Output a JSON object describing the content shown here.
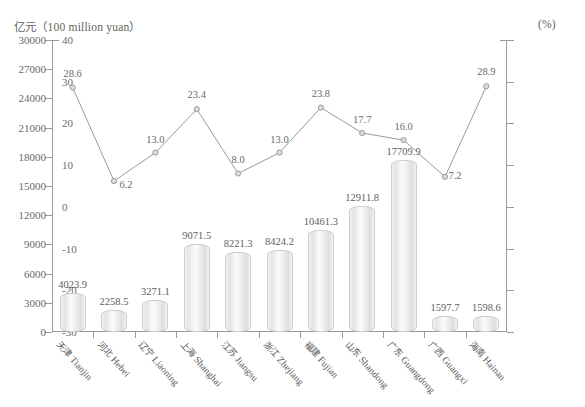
{
  "axes": {
    "left_unit": "亿元（100 million yuan）",
    "right_unit": "(%)",
    "left_ticks": [
      "30000",
      "27000",
      "24000",
      "21000",
      "18000",
      "15000",
      "12000",
      "9000",
      "6000",
      "3000",
      "0"
    ],
    "right_ticks": [
      "40",
      "30",
      "20",
      "10",
      "0",
      "-10",
      "-20",
      "-30"
    ]
  },
  "chart_data": {
    "type": "bar",
    "title": "",
    "subtitle": "",
    "xlabel": "",
    "ylabel": "亿元（100 million yuan）",
    "y2label": "(%)",
    "ylim": [
      0,
      30000
    ],
    "y2lim": [
      -30,
      40
    ],
    "grid": false,
    "legend": "none",
    "categories": [
      "天津 Tianjin",
      "河北 Hebei",
      "辽宁 Liaoning",
      "上海 Shanghai",
      "江苏 Jiangsu",
      "浙江 Zhejiang",
      "福建 Fujian",
      "山东 Shandong",
      "广东 Guangdong",
      "广西 Guangxi",
      "海南 Hainan"
    ],
    "series": [
      {
        "name": "亿元 (100 million yuan)",
        "type": "bar",
        "axis": "left",
        "values": [
          4023.9,
          2258.5,
          3271.1,
          9071.5,
          8221.3,
          8424.2,
          10461.3,
          12911.8,
          17709.9,
          1597.7,
          1598.6
        ],
        "labels": [
          "4023.9",
          "2258.5",
          "3271.1",
          "9071.5",
          "8221.3",
          "8424.2",
          "10461.3",
          "12911.8",
          "17709.9",
          "1597.7",
          "1598.6"
        ]
      },
      {
        "name": "(%)",
        "type": "line",
        "axis": "right",
        "values": [
          28.6,
          6.2,
          13.0,
          23.4,
          8.0,
          13.0,
          23.8,
          17.7,
          16.0,
          7.2,
          28.9
        ],
        "labels": [
          "28.6",
          "6.2",
          "13.0",
          "23.4",
          "8.0",
          "13.0",
          "23.8",
          "17.7",
          "16.0",
          "7.2",
          "28.9"
        ]
      }
    ]
  },
  "style": {
    "bar_edge": "#cfcfcf",
    "line_color": "#9a9a9a",
    "marker_fill": "#dcdcdc",
    "axis_color": "#9a9a9a",
    "text_color": "#5e5e5e"
  }
}
